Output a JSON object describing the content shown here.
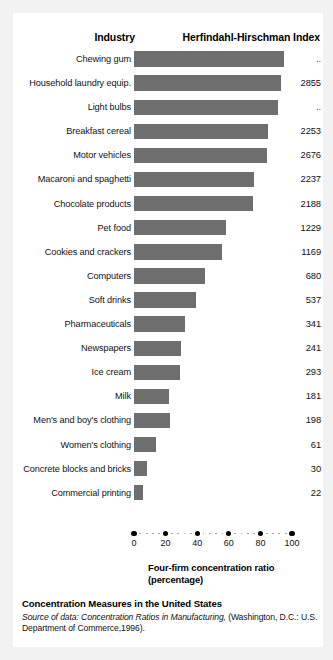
{
  "figure": {
    "columns": {
      "industry_header": "Industry",
      "index_header": "Herfindahl-Hirschman Index"
    },
    "axis_title_line1": "Four-firm concentration ratio",
    "axis_title_line2": "(percentage)",
    "caption_title": "Concentration Measures in the United States",
    "source_prefix": "Source of data:",
    "source_italic": "Concentration Ratios in Manufacturing,",
    "source_rest": "(Washington, D.C.: U.S. Department of Commerce,1996).",
    "bar_color": "#6e6e6e",
    "background_color": "#f2f2f2",
    "card_color": "#ffffff"
  },
  "chart_data": {
    "type": "bar",
    "orientation": "horizontal",
    "title": "Concentration Measures in the United States",
    "xlabel": "Four-firm concentration ratio (percentage)",
    "ylabel": "Industry",
    "xlim": [
      0,
      100
    ],
    "grid": false,
    "legend": "none",
    "xticks": [
      0,
      20,
      40,
      60,
      80,
      100
    ],
    "xtick_labels": [
      "0",
      "20",
      "40",
      "60",
      "80",
      "100"
    ],
    "value_column_header": "Herfindahl-Hirschman Index",
    "categories": [
      "Chewing gum",
      "Household laundry equip.",
      "Light bulbs",
      "Breakfast cereal",
      "Motor vehicles",
      "Macaroni and spaghetti",
      "Chocolate products",
      "Pet food",
      "Cookies and crackers",
      "Computers",
      "Soft drinks",
      "Pharmaceuticals",
      "Newspapers",
      "Ice cream",
      "Milk",
      "Men's and boy's clothing",
      "Women's clothing",
      "Concrete blocks and bricks",
      "Commercial printing"
    ],
    "values": [
      95,
      93,
      91,
      85,
      84,
      76,
      75,
      58,
      56,
      45,
      39,
      32,
      30,
      29,
      22,
      23,
      14,
      8,
      6
    ],
    "hhi_values": [
      "..",
      "2855",
      "..",
      "2253",
      "2676",
      "2237",
      "2188",
      "1229",
      "1169",
      "680",
      "537",
      "341",
      "241",
      "293",
      "181",
      "198",
      "61",
      "30",
      "22"
    ],
    "rows": [
      {
        "industry": "Chewing gum",
        "four_firm_ratio": 95,
        "hhi": ".."
      },
      {
        "industry": "Household laundry equip.",
        "four_firm_ratio": 93,
        "hhi": "2855"
      },
      {
        "industry": "Light bulbs",
        "four_firm_ratio": 91,
        "hhi": ".."
      },
      {
        "industry": "Breakfast cereal",
        "four_firm_ratio": 85,
        "hhi": "2253"
      },
      {
        "industry": "Motor vehicles",
        "four_firm_ratio": 84,
        "hhi": "2676"
      },
      {
        "industry": "Macaroni and spaghetti",
        "four_firm_ratio": 76,
        "hhi": "2237"
      },
      {
        "industry": "Chocolate products",
        "four_firm_ratio": 75,
        "hhi": "2188"
      },
      {
        "industry": "Pet food",
        "four_firm_ratio": 58,
        "hhi": "1229"
      },
      {
        "industry": "Cookies and crackers",
        "four_firm_ratio": 56,
        "hhi": "1169"
      },
      {
        "industry": "Computers",
        "four_firm_ratio": 45,
        "hhi": "680"
      },
      {
        "industry": "Soft drinks",
        "four_firm_ratio": 39,
        "hhi": "537"
      },
      {
        "industry": "Pharmaceuticals",
        "four_firm_ratio": 32,
        "hhi": "341"
      },
      {
        "industry": "Newspapers",
        "four_firm_ratio": 30,
        "hhi": "241"
      },
      {
        "industry": "Ice cream",
        "four_firm_ratio": 29,
        "hhi": "293"
      },
      {
        "industry": "Milk",
        "four_firm_ratio": 22,
        "hhi": "181"
      },
      {
        "industry": "Men's and boy's clothing",
        "four_firm_ratio": 23,
        "hhi": "198"
      },
      {
        "industry": "Women's clothing",
        "four_firm_ratio": 14,
        "hhi": "61"
      },
      {
        "industry": "Concrete blocks and bricks",
        "four_firm_ratio": 8,
        "hhi": "30"
      },
      {
        "industry": "Commercial printing",
        "four_firm_ratio": 6,
        "hhi": "22"
      }
    ]
  }
}
